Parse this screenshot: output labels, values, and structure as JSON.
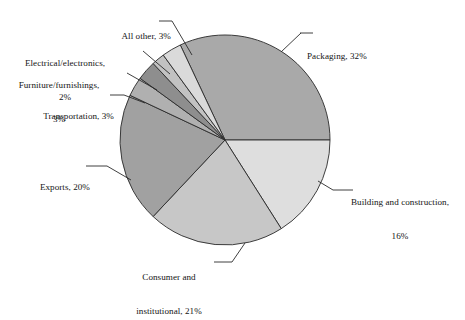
{
  "chart_data": {
    "type": "pie",
    "title": "",
    "subtitle": "",
    "xlabel": "",
    "ylabel": "",
    "legend_position": "none",
    "grid": false,
    "labels_placement": "outside-with-leader-lines",
    "unit": "%",
    "total": 100,
    "categories": [
      "Packaging",
      "Building and construction",
      "Consumer and institutional",
      "Exports",
      "Transportation",
      "Furniture/furnishings",
      "Electrical/electronics",
      "All other"
    ],
    "values": [
      32,
      16,
      21,
      20,
      3,
      3,
      2,
      3
    ],
    "slices": [
      {
        "name": "Packaging",
        "value": 32,
        "label_line1": "Packaging, 32%",
        "label_line2": "",
        "color": "#a9a9a9",
        "start_angle_deg": 0,
        "end_angle_deg": 115.2
      },
      {
        "name": "Building and construction",
        "value": 16,
        "label_line1": "Building and construction,",
        "label_line2": "16%",
        "color": "#dedede",
        "start_angle_deg": 302.4,
        "end_angle_deg": 360
      },
      {
        "name": "Consumer and institutional",
        "value": 21,
        "label_line1": "Consumer and",
        "label_line2": "institutional, 21%",
        "color": "#c7c7c7",
        "start_angle_deg": 226.8,
        "end_angle_deg": 302.4
      },
      {
        "name": "Exports",
        "value": 20,
        "label_line1": "Exports, 20%",
        "label_line2": "",
        "color": "#a1a1a1",
        "start_angle_deg": 154.8,
        "end_angle_deg": 226.8
      },
      {
        "name": "Transportation",
        "value": 3,
        "label_line1": "Transportation, 3%",
        "label_line2": "",
        "color": "#b0b0b0",
        "start_angle_deg": 144.0,
        "end_angle_deg": 154.8
      },
      {
        "name": "Furniture/furnishings",
        "value": 3,
        "label_line1": "Furniture/furnishings,",
        "label_line2": "3%",
        "color": "#8e8e8e",
        "start_angle_deg": 133.2,
        "end_angle_deg": 144.0
      },
      {
        "name": "Electrical/electronics",
        "value": 2,
        "label_line1": "Electrical/electronics,",
        "label_line2": "2%",
        "color": "#c2c2c2",
        "start_angle_deg": 126.0,
        "end_angle_deg": 133.2
      },
      {
        "name": "All other",
        "value": 3,
        "label_line1": "All other, 3%",
        "label_line2": "",
        "color": "#dadada",
        "start_angle_deg": 115.2,
        "end_angle_deg": 126.0
      }
    ],
    "geometry": {
      "center_x": 225,
      "center_y": 140,
      "radius": 105
    },
    "style": {
      "background": "#ffffff",
      "outline_color": "#2a2a2a",
      "leader_line_color": "#2a2a2a",
      "text_color": "#141414"
    }
  }
}
